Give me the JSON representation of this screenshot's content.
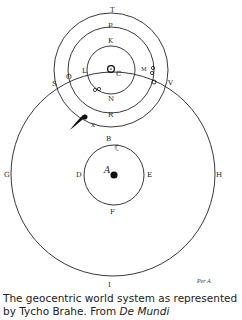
{
  "diagram": {
    "labels": {
      "T": "T",
      "P": "P",
      "K": "K",
      "C": "C",
      "L": "L",
      "M": "M",
      "O": "O",
      "Q": "Q",
      "S": "S",
      "V": "V",
      "N": "N",
      "R": "R",
      "X": "X",
      "B": "B",
      "D": "D",
      "E": "E",
      "F": "F",
      "A": "A",
      "G": "G",
      "H": "H",
      "I": "I"
    },
    "symbols": {
      "sun": "sun-symbol",
      "moon": "☾",
      "earth": "earth-dot",
      "comet": "comet"
    },
    "credit": "Per A"
  },
  "caption": {
    "line1": "The geocentric world system as represented",
    "line2_prefix": "by Tycho Brahe. From ",
    "line2_italic": "De Mundi"
  }
}
